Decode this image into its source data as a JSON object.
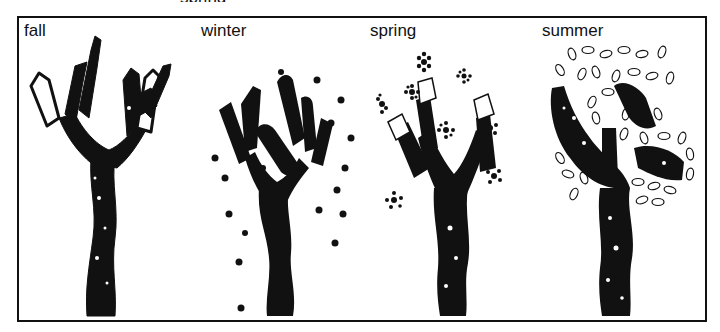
{
  "figure": {
    "cropped_caption_fragment": "spring",
    "panels": [
      {
        "id": "fall",
        "label": "fall",
        "description": "Sponge-printed tree with bare upward-reaching branches"
      },
      {
        "id": "winter",
        "label": "winter",
        "description": "Sponge-printed tree with black dots representing snow"
      },
      {
        "id": "spring",
        "label": "spring",
        "description": "Sponge-printed tree surrounded by small flower/blossom prints"
      },
      {
        "id": "summer",
        "label": "summer",
        "description": "Sponge-printed tree with outlined leaf shapes filling the canopy"
      }
    ],
    "colors": {
      "ink": "#111111",
      "paper": "#ffffff",
      "frame": "#111111"
    }
  }
}
